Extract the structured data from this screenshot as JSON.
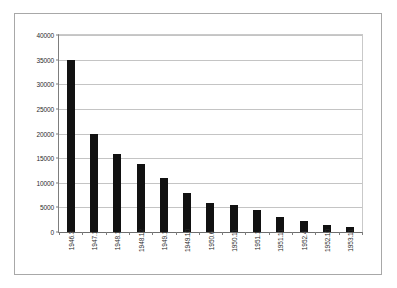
{
  "chart_data": {
    "type": "bar",
    "title": "",
    "subtitle": "",
    "xlabel": "",
    "ylabel": "",
    "ylim": [
      0,
      40000
    ],
    "grid": true,
    "legend": false,
    "legend_position": "none",
    "bar_color": "#111111",
    "gridline_color": "#c4c4c4",
    "yticks": [
      0,
      5000,
      10000,
      15000,
      20000,
      25000,
      30000,
      35000,
      40000
    ],
    "ytick_labels": [
      "0",
      "5000",
      "10000",
      "15000",
      "20000",
      "25000",
      "30000",
      "35000",
      "40000"
    ],
    "categories": [
      "1946.3",
      "1947.1",
      "1948.1",
      "1948.12",
      "1949.1",
      "1949.10",
      "1950.6",
      "1950.11",
      "1951.1",
      "1951.11",
      "1952.4",
      "1952.10",
      "1953.11"
    ],
    "values": [
      35000,
      20000,
      15800,
      13800,
      11000,
      8000,
      5800,
      5500,
      4500,
      3000,
      2200,
      1500,
      1000
    ],
    "series": [
      {
        "name": "",
        "values": [
          35000,
          20000,
          15800,
          13800,
          11000,
          8000,
          5800,
          5500,
          4500,
          3000,
          2200,
          1500,
          1000
        ]
      }
    ]
  }
}
